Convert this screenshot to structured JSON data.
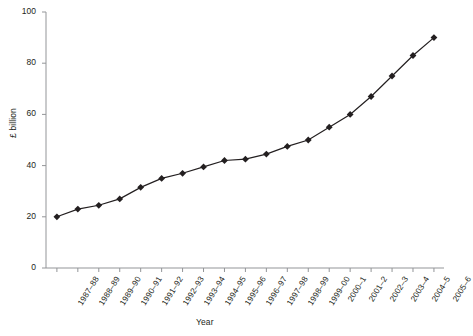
{
  "chart_data": {
    "type": "line",
    "title": "",
    "xlabel": "Year",
    "ylabel": "£ billion",
    "ylim": [
      0,
      100
    ],
    "yticks": [
      0,
      20,
      40,
      60,
      80,
      100
    ],
    "grid": false,
    "legend": null,
    "marker": "diamond",
    "line_color": "#231f20",
    "marker_color": "#231f20",
    "categories": [
      "1987–88",
      "1988–89",
      "1989–90",
      "1990–91",
      "1991–92",
      "1992–93",
      "1993–94",
      "1994–95",
      "1995–96",
      "1996–97",
      "1997–98",
      "1998–99",
      "1999–00",
      "2000–1",
      "2001–2",
      "2002–3",
      "2003–4",
      "2004–5",
      "2005–6"
    ],
    "values": [
      20,
      23,
      24.5,
      27,
      31.5,
      35,
      37,
      39.5,
      42,
      42.5,
      44.5,
      47.5,
      50,
      55,
      60,
      67,
      75,
      83,
      90
    ]
  }
}
